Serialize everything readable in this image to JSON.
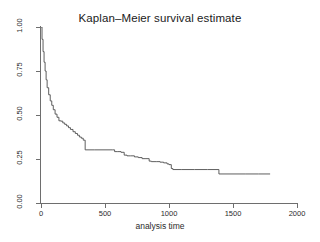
{
  "chart_data": {
    "type": "line",
    "title": "Kaplan–Meier survival estimate",
    "xlabel": "analysis time",
    "ylabel": "",
    "xlim": [
      0,
      2000
    ],
    "ylim": [
      0,
      1
    ],
    "grid": false,
    "legend": null,
    "step_style": "post",
    "xticks": [
      0,
      500,
      1000,
      1500,
      2000
    ],
    "xtick_labels": [
      "0",
      "500",
      "1000",
      "1500",
      "2000"
    ],
    "yticks": [
      0.0,
      0.25,
      0.5,
      0.75,
      1.0
    ],
    "ytick_labels": [
      "0.00",
      "0.25",
      "0.50",
      "0.75",
      "1.00"
    ],
    "series": [
      {
        "name": "Kaplan-Meier survival estimate",
        "color": "#4d4d4d",
        "x": [
          0,
          8,
          16,
          24,
          32,
          40,
          48,
          60,
          72,
          84,
          96,
          110,
          125,
          140,
          155,
          170,
          185,
          200,
          215,
          230,
          250,
          268,
          285,
          300,
          315,
          330,
          345,
          420,
          500,
          560,
          575,
          600,
          625,
          650,
          672,
          700,
          730,
          760,
          790,
          820,
          845,
          862,
          900,
          930,
          958,
          985,
          1000,
          1018,
          1030,
          1100,
          1200,
          1300,
          1375,
          1390,
          1500,
          1600,
          1700,
          1790
        ],
        "y": [
          1.0,
          0.93,
          0.86,
          0.8,
          0.75,
          0.7,
          0.655,
          0.615,
          0.58,
          0.555,
          0.53,
          0.505,
          0.487,
          0.467,
          0.465,
          0.455,
          0.447,
          0.438,
          0.428,
          0.418,
          0.405,
          0.395,
          0.385,
          0.375,
          0.368,
          0.357,
          0.302,
          0.302,
          0.302,
          0.302,
          0.292,
          0.292,
          0.288,
          0.272,
          0.268,
          0.268,
          0.262,
          0.258,
          0.252,
          0.252,
          0.238,
          0.235,
          0.235,
          0.232,
          0.228,
          0.222,
          0.218,
          0.196,
          0.19,
          0.19,
          0.19,
          0.19,
          0.19,
          0.165,
          0.165,
          0.165,
          0.165,
          0.165
        ]
      }
    ]
  },
  "figure": {
    "background_color": "#ffffff",
    "axis_color": "#6e6e6e",
    "text_color": "#2b2b2b",
    "title_color": "#1a1a1a"
  }
}
